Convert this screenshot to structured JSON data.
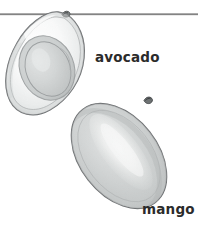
{
  "illustration": {
    "title": "Fruit cross-section illustration",
    "style": "grayscale pencil drawing",
    "background_color": "#ffffff",
    "rule": {
      "name": "horizontal-divider",
      "color": "#5a5a5a",
      "y": 14,
      "x_start": 0,
      "x_end": 198,
      "thickness": 1.2
    },
    "items": [
      {
        "id": "avocado",
        "label": "avocado",
        "label_color": "#2b2b2b",
        "description": "halved avocado showing pit in center cavity",
        "outline_color": "#6b6e70",
        "flesh_color": "#f2f3f3",
        "skin_shade": "#c9cccd",
        "pit_color": "#b7bcbc",
        "pit_outline": "#74797a",
        "center_x": 48,
        "center_y": 62,
        "width": 86,
        "height": 105,
        "rotation_deg": -18,
        "has_stem": true,
        "stem_color": "#5d6162"
      },
      {
        "id": "mango",
        "label": "mango",
        "label_color": "#2b2b2b",
        "description": "whole mango, tilted oval with bright central highlight",
        "outline_color": "#6b6e70",
        "body_color": "#b9bdbd",
        "highlight_color": "#f4f5f4",
        "rim_shade": "#9aa0a0",
        "center_x": 119,
        "center_y": 156,
        "width": 78,
        "height": 118,
        "rotation_deg": -38,
        "has_stem": true,
        "stem_color": "#4d5152"
      }
    ]
  }
}
